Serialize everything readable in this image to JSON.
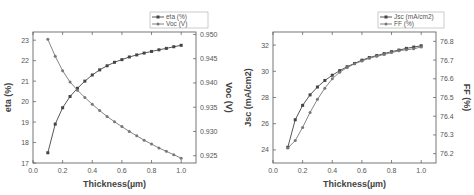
{
  "chart_data": [
    {
      "type": "line",
      "title": "",
      "xlabel": "Thickness(µm)",
      "ylabel": "eta (%)",
      "y2label": "Voc (V)",
      "xlim": [
        0.0,
        1.1
      ],
      "ylim": [
        17,
        23.4
      ],
      "y2lim": [
        0.9235,
        0.9505
      ],
      "xticks": [
        "0.0",
        "0.2",
        "0.4",
        "0.6",
        "0.8",
        "1.0"
      ],
      "yticks": [
        "17",
        "18",
        "19",
        "20",
        "21",
        "22",
        "23"
      ],
      "y2ticks": [
        "0.925",
        "0.930",
        "0.935",
        "0.940",
        "0.945",
        "0.950"
      ],
      "legend": [
        "eta (%)",
        "Voc (V)"
      ],
      "legend_position": "top-right",
      "grid": false,
      "x": [
        0.1,
        0.15,
        0.2,
        0.25,
        0.3,
        0.35,
        0.4,
        0.45,
        0.5,
        0.55,
        0.6,
        0.65,
        0.7,
        0.75,
        0.8,
        0.85,
        0.9,
        0.95,
        1.0
      ],
      "series": [
        {
          "name": "eta (%)",
          "axis": "left",
          "marker": "square",
          "values": [
            17.5,
            18.9,
            19.7,
            20.25,
            20.65,
            21.0,
            21.3,
            21.55,
            21.75,
            21.92,
            22.05,
            22.18,
            22.28,
            22.37,
            22.45,
            22.53,
            22.6,
            22.68,
            22.75
          ]
        },
        {
          "name": "Voc (V)",
          "axis": "right",
          "marker": "circle",
          "values": [
            0.949,
            0.9455,
            0.9425,
            0.9402,
            0.9385,
            0.937,
            0.9356,
            0.9343,
            0.9331,
            0.932,
            0.931,
            0.93,
            0.9291,
            0.9282,
            0.9274,
            0.9266,
            0.9259,
            0.9252,
            0.9245
          ]
        }
      ]
    },
    {
      "type": "line",
      "title": "",
      "xlabel": "Thickness(µm)",
      "ylabel": "Jsc (mA/cm2)",
      "y2label": "FF (%)",
      "xlim": [
        0.0,
        1.1
      ],
      "ylim": [
        23,
        33
      ],
      "y2lim": [
        76.15,
        76.85
      ],
      "xticks": [
        "0.0",
        "0.2",
        "0.4",
        "0.6",
        "0.8",
        "1.0"
      ],
      "yticks": [
        "24",
        "26",
        "28",
        "30",
        "32"
      ],
      "y2ticks": [
        "76.2",
        "76.3",
        "76.4",
        "76.5",
        "76.6",
        "76.7",
        "76.8"
      ],
      "legend": [
        "Jsc (mA/cm2)",
        "FF (%)"
      ],
      "legend_position": "top-right",
      "grid": false,
      "x": [
        0.1,
        0.15,
        0.2,
        0.25,
        0.3,
        0.35,
        0.4,
        0.45,
        0.5,
        0.55,
        0.6,
        0.65,
        0.7,
        0.75,
        0.8,
        0.85,
        0.9,
        0.95,
        1.0
      ],
      "series": [
        {
          "name": "Jsc (mA/cm2)",
          "axis": "left",
          "marker": "square",
          "values": [
            24.2,
            26.3,
            27.4,
            28.2,
            28.8,
            29.3,
            29.7,
            30.05,
            30.35,
            30.6,
            30.85,
            31.05,
            31.2,
            31.35,
            31.5,
            31.62,
            31.75,
            31.85,
            31.95
          ]
        },
        {
          "name": "FF (%)",
          "axis": "right",
          "marker": "circle",
          "values": [
            76.23,
            76.27,
            76.34,
            76.42,
            76.49,
            76.55,
            76.6,
            76.635,
            76.66,
            76.68,
            76.695,
            76.71,
            76.72,
            76.73,
            76.74,
            76.75,
            76.755,
            76.76,
            76.77
          ]
        }
      ]
    }
  ],
  "styles": {
    "line_color_primary": "#444444",
    "line_color_secondary": "#777777",
    "axis_color": "#555555"
  }
}
